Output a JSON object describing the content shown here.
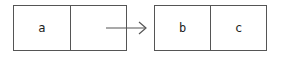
{
  "diagram": {
    "type": "linked-list-node-transition",
    "left_node": {
      "cells": [
        "a",
        ""
      ]
    },
    "right_node": {
      "cells": [
        "b",
        "c"
      ]
    },
    "arrow": {
      "from": "left_node.cells.1",
      "to": "right_node",
      "direction": "right"
    },
    "colors": {
      "stroke": "#555555",
      "text": "#222222",
      "background": "#ffffff"
    }
  }
}
